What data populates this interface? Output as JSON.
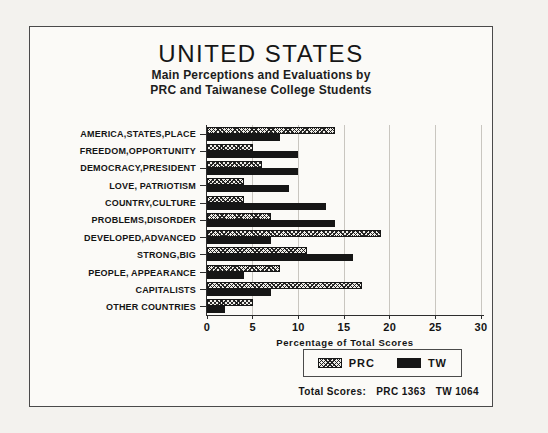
{
  "chart": {
    "title": "UNITED STATES",
    "subtitle_line1": "Main Perceptions and Evaluations by",
    "subtitle_line2": "PRC and Taiwanese College Students",
    "totals": {
      "label": "Total Scores:",
      "prc": "PRC 1363",
      "tw": "TW 1064"
    }
  },
  "chart_data": {
    "type": "bar",
    "orientation": "horizontal",
    "title": "UNITED STATES",
    "subtitle": "Main Perceptions and Evaluations by PRC and Taiwanese College Students",
    "categories": [
      "AMERICA,STATES,PLACE",
      "FREEDOM,OPPORTUNITY",
      "DEMOCRACY,PRESIDENT",
      "LOVE, PATRIOTISM",
      "COUNTRY,CULTURE",
      "PROBLEMS,DISORDER",
      "DEVELOPED,ADVANCED",
      "STRONG,BIG",
      "PEOPLE, APPEARANCE",
      "CAPITALISTS",
      "OTHER COUNTRIES"
    ],
    "series": [
      {
        "name": "PRC",
        "style": "hatched",
        "values": [
          14,
          5,
          6,
          4,
          4,
          7,
          19,
          11,
          8,
          17,
          5
        ]
      },
      {
        "name": "TW",
        "style": "solid-black",
        "values": [
          8,
          10,
          10,
          9,
          13,
          14,
          7,
          16,
          4,
          7,
          2
        ]
      }
    ],
    "xlabel": "Percentage of Total Scores",
    "ylabel": "",
    "xlim": [
      0,
      30
    ],
    "xticks": [
      0,
      5,
      10,
      15,
      20,
      25,
      30
    ],
    "grid": "vertical-on",
    "legend_position": "bottom-right",
    "legend_entries": [
      "PRC",
      "TW"
    ],
    "annotation_total_scores": {
      "PRC": 1363,
      "TW": 1064
    },
    "colors": {
      "tw_bar": "#161616",
      "prc_bar_pattern": "black-crosshatch-on-white",
      "gridline": "#c9c6c0",
      "background": "#fbfaf7"
    }
  }
}
